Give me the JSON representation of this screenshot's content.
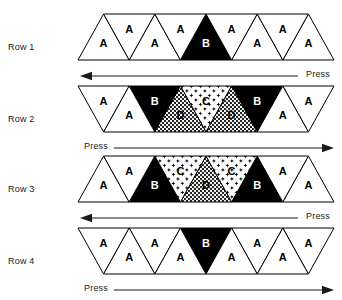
{
  "diagram": {
    "title": "",
    "rows": [
      {
        "label": "Row 1",
        "orientation": "up-edges",
        "up_triangles": [
          {
            "glyph": "A",
            "fill": "white"
          },
          {
            "glyph": "A",
            "fill": "white"
          },
          {
            "glyph": "B",
            "fill": "black"
          },
          {
            "glyph": "A",
            "fill": "white"
          },
          {
            "glyph": "A",
            "fill": "white"
          }
        ],
        "down_triangles": [
          {
            "glyph": "A",
            "fill": "white"
          },
          {
            "glyph": "A",
            "fill": "white"
          },
          {
            "glyph": "A",
            "fill": "white"
          },
          {
            "glyph": "A",
            "fill": "white"
          }
        ],
        "arrow": {
          "direction": "left",
          "label": "Press",
          "label_side": "right"
        }
      },
      {
        "label": "Row 2",
        "orientation": "down-edges",
        "down_triangles": [
          {
            "glyph": "A",
            "fill": "white"
          },
          {
            "glyph": "B",
            "fill": "black"
          },
          {
            "glyph": "C",
            "fill": "star"
          },
          {
            "glyph": "B",
            "fill": "black"
          },
          {
            "glyph": "A",
            "fill": "white"
          }
        ],
        "up_triangles": [
          {
            "glyph": "A",
            "fill": "white"
          },
          {
            "glyph": "D",
            "fill": "dense"
          },
          {
            "glyph": "D",
            "fill": "dense"
          },
          {
            "glyph": "A",
            "fill": "white"
          }
        ],
        "arrow": {
          "direction": "right",
          "label": "Press",
          "label_side": "left"
        }
      },
      {
        "label": "Row 3",
        "orientation": "up-edges",
        "up_triangles": [
          {
            "glyph": "A",
            "fill": "white"
          },
          {
            "glyph": "B",
            "fill": "black"
          },
          {
            "glyph": "D",
            "fill": "dense"
          },
          {
            "glyph": "B",
            "fill": "black"
          },
          {
            "glyph": "A",
            "fill": "white"
          }
        ],
        "down_triangles": [
          {
            "glyph": "A",
            "fill": "white"
          },
          {
            "glyph": "C",
            "fill": "star"
          },
          {
            "glyph": "C",
            "fill": "star"
          },
          {
            "glyph": "A",
            "fill": "white"
          }
        ],
        "arrow": {
          "direction": "left",
          "label": "Press",
          "label_side": "right"
        }
      },
      {
        "label": "Row 4",
        "orientation": "down-edges",
        "down_triangles": [
          {
            "glyph": "A",
            "fill": "white"
          },
          {
            "glyph": "A",
            "fill": "white"
          },
          {
            "glyph": "B",
            "fill": "black"
          },
          {
            "glyph": "A",
            "fill": "white"
          },
          {
            "glyph": "A",
            "fill": "white"
          }
        ],
        "up_triangles": [
          {
            "glyph": "A",
            "fill": "white"
          },
          {
            "glyph": "A",
            "fill": "white"
          },
          {
            "glyph": "A",
            "fill": "white"
          },
          {
            "glyph": "A",
            "fill": "white"
          }
        ],
        "arrow": {
          "direction": "right",
          "label": "Press",
          "label_side": "left"
        }
      }
    ],
    "colors": {
      "outline": "#000000",
      "solid": "#000000",
      "background": "#ffffff",
      "text": "#1a1a1a"
    }
  }
}
